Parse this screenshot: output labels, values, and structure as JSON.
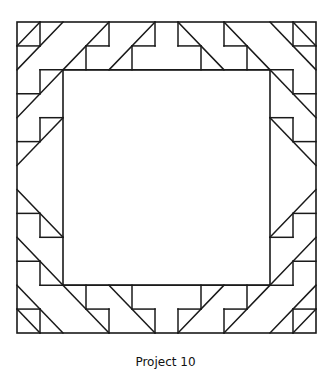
{
  "figure": {
    "caption": "Project 10",
    "line_color": "#1a1a1a",
    "grid_units": 13,
    "outer_border": [
      [
        0,
        0
      ],
      [
        13,
        13
      ]
    ],
    "inner_square": [
      [
        2,
        2
      ],
      [
        11,
        11
      ]
    ],
    "segments": [
      {
        "group": "corner-tl",
        "pts": [
          [
            0,
            1
          ],
          [
            1,
            1
          ]
        ]
      },
      {
        "group": "corner-tl",
        "pts": [
          [
            1,
            0
          ],
          [
            1,
            1
          ]
        ]
      },
      {
        "group": "corner-tl",
        "pts": [
          [
            0,
            1
          ],
          [
            1,
            0
          ]
        ]
      },
      {
        "group": "corner-tl",
        "pts": [
          [
            0,
            2
          ],
          [
            2,
            0
          ]
        ]
      },
      {
        "group": "top",
        "pts": [
          [
            2,
            2
          ],
          [
            4,
            0
          ]
        ]
      },
      {
        "group": "top",
        "pts": [
          [
            4,
            0
          ],
          [
            4,
            1
          ]
        ]
      },
      {
        "group": "top",
        "pts": [
          [
            3,
            1
          ],
          [
            4,
            1
          ]
        ]
      },
      {
        "group": "top",
        "pts": [
          [
            3,
            1
          ],
          [
            3,
            2
          ]
        ]
      },
      {
        "group": "top",
        "pts": [
          [
            4,
            2
          ],
          [
            6,
            0
          ]
        ]
      },
      {
        "group": "top",
        "pts": [
          [
            6,
            0
          ],
          [
            6,
            1
          ]
        ]
      },
      {
        "group": "top",
        "pts": [
          [
            5,
            1
          ],
          [
            6,
            1
          ]
        ]
      },
      {
        "group": "top",
        "pts": [
          [
            5,
            1
          ],
          [
            5,
            2
          ]
        ]
      },
      {
        "group": "top",
        "pts": [
          [
            7,
            0
          ],
          [
            7,
            1
          ]
        ]
      },
      {
        "group": "top",
        "pts": [
          [
            7,
            1
          ],
          [
            8,
            1
          ]
        ]
      },
      {
        "group": "top",
        "pts": [
          [
            8,
            1
          ],
          [
            8,
            2
          ]
        ]
      },
      {
        "group": "top",
        "pts": [
          [
            7,
            0
          ],
          [
            9,
            2
          ]
        ]
      },
      {
        "group": "top",
        "pts": [
          [
            9,
            0
          ],
          [
            9,
            1
          ]
        ]
      },
      {
        "group": "top",
        "pts": [
          [
            9,
            1
          ],
          [
            10,
            1
          ]
        ]
      },
      {
        "group": "top",
        "pts": [
          [
            10,
            1
          ],
          [
            10,
            2
          ]
        ]
      },
      {
        "group": "top",
        "pts": [
          [
            9,
            0
          ],
          [
            11,
            2
          ]
        ]
      },
      {
        "group": "top",
        "pts": [
          [
            1,
            2
          ],
          [
            12,
            2
          ]
        ]
      },
      {
        "group": "corner-tr",
        "pts": [
          [
            11,
            0
          ],
          [
            13,
            2
          ]
        ]
      },
      {
        "group": "corner-tr",
        "pts": [
          [
            12,
            0
          ],
          [
            12,
            1
          ]
        ]
      },
      {
        "group": "corner-tr",
        "pts": [
          [
            12,
            1
          ],
          [
            13,
            1
          ]
        ]
      },
      {
        "group": "corner-tr",
        "pts": [
          [
            12,
            0
          ],
          [
            13,
            1
          ]
        ]
      },
      {
        "group": "left",
        "pts": [
          [
            1,
            2
          ],
          [
            1,
            3
          ]
        ]
      },
      {
        "group": "left",
        "pts": [
          [
            0,
            3
          ],
          [
            1,
            3
          ]
        ]
      },
      {
        "group": "left",
        "pts": [
          [
            0,
            4
          ],
          [
            2,
            2
          ]
        ]
      },
      {
        "group": "left",
        "pts": [
          [
            1,
            4
          ],
          [
            2,
            4
          ]
        ]
      },
      {
        "group": "left",
        "pts": [
          [
            1,
            4
          ],
          [
            1,
            5
          ]
        ]
      },
      {
        "group": "left",
        "pts": [
          [
            0,
            5
          ],
          [
            1,
            5
          ]
        ]
      },
      {
        "group": "left",
        "pts": [
          [
            0,
            6
          ],
          [
            2,
            4
          ]
        ]
      },
      {
        "group": "left",
        "pts": [
          [
            0,
            7
          ],
          [
            2,
            9
          ]
        ]
      },
      {
        "group": "left",
        "pts": [
          [
            0,
            8
          ],
          [
            1,
            8
          ]
        ]
      },
      {
        "group": "left",
        "pts": [
          [
            1,
            8
          ],
          [
            1,
            9
          ]
        ]
      },
      {
        "group": "left",
        "pts": [
          [
            1,
            9
          ],
          [
            2,
            9
          ]
        ]
      },
      {
        "group": "left",
        "pts": [
          [
            0,
            9
          ],
          [
            2,
            11
          ]
        ]
      },
      {
        "group": "left",
        "pts": [
          [
            0,
            10
          ],
          [
            1,
            10
          ]
        ]
      },
      {
        "group": "left",
        "pts": [
          [
            1,
            10
          ],
          [
            1,
            11
          ]
        ]
      },
      {
        "group": "right",
        "pts": [
          [
            12,
            2
          ],
          [
            12,
            3
          ]
        ]
      },
      {
        "group": "right",
        "pts": [
          [
            12,
            3
          ],
          [
            13,
            3
          ]
        ]
      },
      {
        "group": "right",
        "pts": [
          [
            11,
            2
          ],
          [
            13,
            4
          ]
        ]
      },
      {
        "group": "right",
        "pts": [
          [
            11,
            4
          ],
          [
            12,
            4
          ]
        ]
      },
      {
        "group": "right",
        "pts": [
          [
            12,
            4
          ],
          [
            12,
            5
          ]
        ]
      },
      {
        "group": "right",
        "pts": [
          [
            12,
            5
          ],
          [
            13,
            5
          ]
        ]
      },
      {
        "group": "right",
        "pts": [
          [
            11,
            4
          ],
          [
            13,
            6
          ]
        ]
      },
      {
        "group": "right",
        "pts": [
          [
            13,
            7
          ],
          [
            11,
            9
          ]
        ]
      },
      {
        "group": "right",
        "pts": [
          [
            12,
            8
          ],
          [
            13,
            8
          ]
        ]
      },
      {
        "group": "right",
        "pts": [
          [
            12,
            8
          ],
          [
            12,
            9
          ]
        ]
      },
      {
        "group": "right",
        "pts": [
          [
            11,
            9
          ],
          [
            12,
            9
          ]
        ]
      },
      {
        "group": "right",
        "pts": [
          [
            13,
            9
          ],
          [
            11,
            11
          ]
        ]
      },
      {
        "group": "right",
        "pts": [
          [
            12,
            10
          ],
          [
            13,
            10
          ]
        ]
      },
      {
        "group": "right",
        "pts": [
          [
            12,
            10
          ],
          [
            12,
            11
          ]
        ]
      },
      {
        "group": "bottom",
        "pts": [
          [
            1,
            11
          ],
          [
            12,
            11
          ]
        ]
      },
      {
        "group": "bottom",
        "pts": [
          [
            2,
            11
          ],
          [
            4,
            13
          ]
        ]
      },
      {
        "group": "bottom",
        "pts": [
          [
            3,
            11
          ],
          [
            3,
            12
          ]
        ]
      },
      {
        "group": "bottom",
        "pts": [
          [
            3,
            12
          ],
          [
            4,
            12
          ]
        ]
      },
      {
        "group": "bottom",
        "pts": [
          [
            4,
            12
          ],
          [
            4,
            13
          ]
        ]
      },
      {
        "group": "bottom",
        "pts": [
          [
            4,
            11
          ],
          [
            6,
            13
          ]
        ]
      },
      {
        "group": "bottom",
        "pts": [
          [
            5,
            11
          ],
          [
            5,
            12
          ]
        ]
      },
      {
        "group": "bottom",
        "pts": [
          [
            5,
            12
          ],
          [
            6,
            12
          ]
        ]
      },
      {
        "group": "bottom",
        "pts": [
          [
            6,
            12
          ],
          [
            6,
            13
          ]
        ]
      },
      {
        "group": "bottom",
        "pts": [
          [
            7,
            12
          ],
          [
            7,
            13
          ]
        ]
      },
      {
        "group": "bottom",
        "pts": [
          [
            7,
            12
          ],
          [
            8,
            12
          ]
        ]
      },
      {
        "group": "bottom",
        "pts": [
          [
            8,
            11
          ],
          [
            8,
            12
          ]
        ]
      },
      {
        "group": "bottom",
        "pts": [
          [
            7,
            13
          ],
          [
            9,
            11
          ]
        ]
      },
      {
        "group": "bottom",
        "pts": [
          [
            9,
            12
          ],
          [
            9,
            13
          ]
        ]
      },
      {
        "group": "bottom",
        "pts": [
          [
            9,
            12
          ],
          [
            10,
            12
          ]
        ]
      },
      {
        "group": "bottom",
        "pts": [
          [
            10,
            11
          ],
          [
            10,
            12
          ]
        ]
      },
      {
        "group": "bottom",
        "pts": [
          [
            9,
            13
          ],
          [
            11,
            11
          ]
        ]
      },
      {
        "group": "corner-bl",
        "pts": [
          [
            0,
            11
          ],
          [
            2,
            13
          ]
        ]
      },
      {
        "group": "corner-bl",
        "pts": [
          [
            0,
            12
          ],
          [
            1,
            12
          ]
        ]
      },
      {
        "group": "corner-bl",
        "pts": [
          [
            1,
            12
          ],
          [
            1,
            13
          ]
        ]
      },
      {
        "group": "corner-bl",
        "pts": [
          [
            0,
            12
          ],
          [
            1,
            13
          ]
        ]
      },
      {
        "group": "corner-br",
        "pts": [
          [
            11,
            13
          ],
          [
            13,
            11
          ]
        ]
      },
      {
        "group": "corner-br",
        "pts": [
          [
            12,
            12
          ],
          [
            13,
            12
          ]
        ]
      },
      {
        "group": "corner-br",
        "pts": [
          [
            12,
            12
          ],
          [
            12,
            13
          ]
        ]
      },
      {
        "group": "corner-br",
        "pts": [
          [
            12,
            13
          ],
          [
            13,
            12
          ]
        ]
      }
    ]
  }
}
